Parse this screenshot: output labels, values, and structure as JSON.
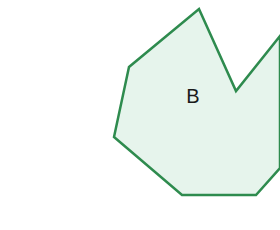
{
  "diagram": {
    "shape": {
      "type": "polygon",
      "label": "B",
      "fill_color": "#e6f4ec",
      "stroke_color": "#2e8b4e",
      "stroke_width": 2.5,
      "points": [
        [
          199,
          9
        ],
        [
          236,
          91
        ],
        [
          280,
          36
        ],
        [
          280,
          168
        ],
        [
          256,
          195
        ],
        [
          182,
          195
        ],
        [
          114,
          137
        ],
        [
          129,
          67
        ]
      ]
    }
  }
}
